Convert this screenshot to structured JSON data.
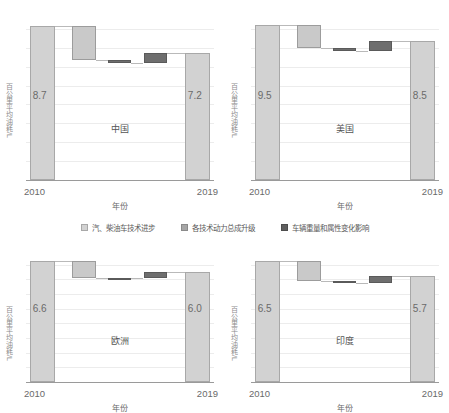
{
  "axis": {
    "ylabel": "百公里平均油耗/L",
    "xlabel": "年份",
    "start_year": "2010",
    "end_year": "2019"
  },
  "legend": [
    {
      "key": "light",
      "label": "汽、柴油车技术进步",
      "color": "#d2d2d2"
    },
    {
      "key": "mid",
      "label": "各技术动力总成升级",
      "color": "#a6a6a6"
    },
    {
      "key": "dark",
      "label": "车辆重量和属性变化影响",
      "color": "#5f5f5f"
    }
  ],
  "chart_data": [
    {
      "type": "bar",
      "title": "中国",
      "xlabel": "年份",
      "ylabel": "百公里平均油耗/L",
      "categories": [
        "2010",
        "汽、柴油车技术进步",
        "各技术动力总成升级",
        "车辆重量和属性变化影响",
        "2019"
      ],
      "values": [
        8.7,
        -1.9,
        -0.2,
        0.6,
        7.2
      ],
      "start_value": "8.7",
      "end_value": "7.2",
      "ylim": [
        0,
        9.6
      ],
      "grid": true
    },
    {
      "type": "bar",
      "title": "美国",
      "xlabel": "年份",
      "ylabel": "百公里平均油耗/L",
      "categories": [
        "2010",
        "汽、柴油车技术进步",
        "各技术动力总成升级",
        "车辆重量和属性变化影响",
        "2019"
      ],
      "values": [
        9.5,
        -1.4,
        -0.2,
        0.6,
        8.5
      ],
      "start_value": "9.5",
      "end_value": "8.5",
      "ylim": [
        0,
        10.4
      ],
      "grid": true
    },
    {
      "type": "bar",
      "title": "欧洲",
      "xlabel": "年份",
      "ylabel": "百公里平均油耗/L",
      "categories": [
        "2010",
        "汽、柴油车技术进步",
        "各技术动力总成升级",
        "车辆重量和属性变化影响",
        "2019"
      ],
      "values": [
        6.6,
        -0.9,
        -0.05,
        0.35,
        6.0
      ],
      "start_value": "6.6",
      "end_value": "6.0",
      "ylim": [
        0,
        7.2
      ],
      "grid": true
    },
    {
      "type": "bar",
      "title": "印度",
      "xlabel": "年份",
      "ylabel": "百公里平均油耗/L",
      "categories": [
        "2010",
        "汽、柴油车技术进步",
        "各技术动力总成升级",
        "车辆重量和属性变化影响",
        "2019"
      ],
      "values": [
        6.5,
        -1.05,
        -0.1,
        0.35,
        5.7
      ],
      "start_value": "6.5",
      "end_value": "5.7",
      "ylim": [
        0,
        7.1
      ],
      "grid": true
    }
  ]
}
